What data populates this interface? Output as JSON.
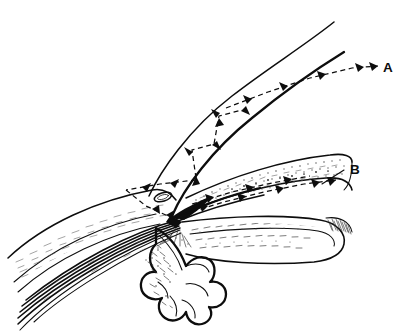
{
  "figure": {
    "background_color": "#ffffff",
    "ink_color": "#0d0d0d",
    "width": 407,
    "height": 333,
    "style": "pen-and-ink anatomical line drawing",
    "labels": [
      {
        "id": "label-a",
        "text": "A",
        "x": 383,
        "y": 72,
        "leader": "dashed flow arrow arriving from lower-left along inner corneal surface",
        "pathway": "trabecular / conventional outflow"
      },
      {
        "id": "label-b",
        "text": "B",
        "x": 350,
        "y": 174,
        "leader": "solid straight leader line running down-left to the intrascleral channel",
        "pathway": "uveoscleral / intrascleral collector channel"
      }
    ],
    "structures": [
      {
        "name": "cornea-outer-surface",
        "description": "upper long arc sweeping from lower-left to upper-right"
      },
      {
        "name": "cornea-inner-surface",
        "description": "lower parallel arc, corneal endothelium"
      },
      {
        "name": "sclera",
        "description": "stippled band running to the right, cut edge hatched at far right"
      },
      {
        "name": "schlemms-canal",
        "description": "small outlined oval lumen just above the angle apex"
      },
      {
        "name": "trabecular-meshwork",
        "description": "dark wedge converging at the angle apex"
      },
      {
        "name": "scleral-spur",
        "description": "convergence point of meshwork, sclera and ciliary muscle"
      },
      {
        "name": "ciliary-muscle",
        "description": "bundle of parallel curved fibre lines sweeping to lower-left"
      },
      {
        "name": "ciliary-processes",
        "description": "finger-like lobed projections at bottom centre"
      },
      {
        "name": "iris-root",
        "description": "stippled body extending right from the angle"
      },
      {
        "name": "intrascleral-channel",
        "description": "dashed arrow channel inside sclera leading to B"
      }
    ],
    "flow_arrows": [
      {
        "name": "flow-anterior-chamber-zigzag",
        "direction": "upward and rightward",
        "count": 6
      },
      {
        "name": "flow-along-cornea",
        "direction": "rightward toward A",
        "count": 4
      },
      {
        "name": "flow-into-angle",
        "direction": "converging on angle apex",
        "count": 4
      },
      {
        "name": "flow-intrascleral",
        "direction": "rightward toward B",
        "count": 5
      }
    ]
  }
}
